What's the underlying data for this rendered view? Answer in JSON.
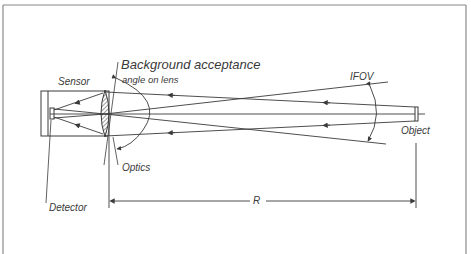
{
  "diagram": {
    "labels": {
      "background_acceptance": "Background acceptance",
      "angle_on_lens": "angle on lens",
      "sensor": "Sensor",
      "optics": "Optics",
      "detector": "Detector",
      "ifov": "IFOV",
      "object": "Object",
      "range": "R"
    },
    "colors": {
      "line": "#3a3a3a",
      "frame": "#8a8a8a",
      "background": "#ffffff"
    }
  }
}
